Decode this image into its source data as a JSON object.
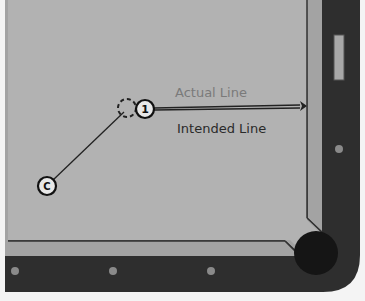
{
  "diagram": {
    "labels": {
      "actual_line": "Actual Line",
      "intended_line": "Intended Line"
    },
    "balls": [
      {
        "id": "cue",
        "label": "C",
        "cx": 47,
        "cy": 186
      },
      {
        "id": "object",
        "label": "1",
        "cx": 145,
        "cy": 109
      },
      {
        "id": "ghost",
        "label": "",
        "cx": 127,
        "cy": 108
      }
    ],
    "colors": {
      "background": "#f4f4f4",
      "felt": "#b0b0b0",
      "cushion": "#a3a3a3",
      "rail": "#2e2e2e",
      "pocket": "#151515",
      "diamond": "#8a8a8a",
      "actual_text": "#7a7a7a",
      "intended_text": "#2a2a2a",
      "line": "#222222"
    }
  }
}
